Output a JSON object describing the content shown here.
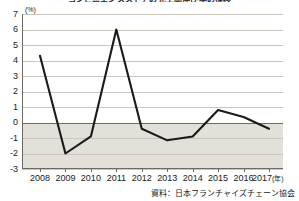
{
  "chart_data": {
    "type": "line",
    "title": "コンビニエンスストアの売上高伸び率の推移",
    "subtitle": "",
    "xlabel": "年",
    "ylabel": "%",
    "unit_label": "(%)",
    "x_axis_suffix": "(年)",
    "categories": [
      "2008",
      "2009",
      "2010",
      "2011",
      "2012",
      "2013",
      "2014",
      "2015",
      "2016",
      "2017"
    ],
    "values": [
      4.3,
      -2.0,
      -0.9,
      6.0,
      -0.4,
      -1.15,
      -0.9,
      0.8,
      0.35,
      -0.4
    ],
    "series": [
      {
        "name": "売上高伸び率",
        "values": [
          4.3,
          -2.0,
          -0.9,
          6.0,
          -0.4,
          -1.15,
          -0.9,
          0.8,
          0.35,
          -0.4
        ]
      }
    ],
    "ylim": [
      -3,
      7
    ],
    "y_ticks": [
      "7",
      "6",
      "5",
      "4",
      "3",
      "2",
      "1",
      "0",
      "-1",
      "-2",
      "-3"
    ],
    "y_tick_values": [
      7,
      6,
      5,
      4,
      3,
      2,
      1,
      0,
      -1,
      -2,
      -3
    ],
    "xlim": [
      "2008",
      "2017"
    ],
    "grid": true,
    "legend": false,
    "legend_position": "none",
    "zero_line": 0,
    "negative_region_shaded": true,
    "colors": {
      "line": "#1a1a1a",
      "grid": "#c9c6bd",
      "axis": "#6d6a63",
      "negative_band": "#e2e0d8",
      "plot_background": "#ffffff",
      "text": "#1a1a1a"
    },
    "annotations": []
  },
  "source": {
    "label": "資料：日本フランチャイズチェーン協会"
  }
}
